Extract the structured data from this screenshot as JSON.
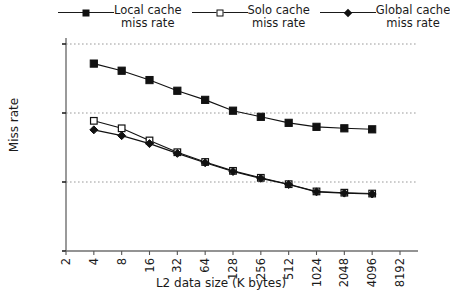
{
  "chart_data": {
    "type": "line",
    "title": "",
    "xlabel": "L2 data size (K bytes)",
    "ylabel": "Miss rate",
    "xscale": "log",
    "yscale": "log",
    "xlim": [
      2,
      8192
    ],
    "ylim": [
      0.001,
      1
    ],
    "grid": true,
    "grid_style": "dotted-horizontal-at-decades",
    "legend_position": "top",
    "xticks": [
      "2",
      "4",
      "8",
      "16",
      "32",
      "64",
      "128",
      "256",
      "512",
      "1024",
      "2048",
      "4096",
      "8192"
    ],
    "yticks": [
      "1",
      "0.1",
      "0.01",
      "0.001"
    ],
    "x": [
      4,
      8,
      16,
      32,
      64,
      128,
      256,
      512,
      1024,
      2048,
      4096
    ],
    "series": [
      {
        "name": "Local cache miss rate",
        "marker": "filled-square",
        "color": "#111111",
        "values": [
          0.52,
          0.41,
          0.3,
          0.21,
          0.155,
          0.108,
          0.088,
          0.072,
          0.063,
          0.06,
          0.058
        ]
      },
      {
        "name": "Solo cache miss rate",
        "marker": "open-square",
        "color": "#111111",
        "values": [
          0.077,
          0.06,
          0.04,
          0.027,
          0.0195,
          0.0145,
          0.0115,
          0.0093,
          0.0073,
          0.007,
          0.0068
        ]
      },
      {
        "name": "Global cache miss rate",
        "marker": "diamond",
        "color": "#111111",
        "values": [
          0.057,
          0.047,
          0.036,
          0.026,
          0.019,
          0.0142,
          0.0113,
          0.0092,
          0.0072,
          0.0069,
          0.0067
        ]
      }
    ]
  },
  "legend": {
    "entries": [
      {
        "line1": "Local cache",
        "line2": "miss rate",
        "marker": "filled-square"
      },
      {
        "line1": "Solo cache",
        "line2": "miss rate",
        "marker": "open-square"
      },
      {
        "line1": "Global cache",
        "line2": "miss rate",
        "marker": "diamond"
      }
    ]
  },
  "axes": {
    "x_title": "L2 data size (K bytes)",
    "y_title": "Miss rate"
  },
  "colors": {
    "ink": "#111111",
    "axis": "#6f6f6f",
    "grid": "#9a9a9a",
    "background": "#ffffff"
  }
}
